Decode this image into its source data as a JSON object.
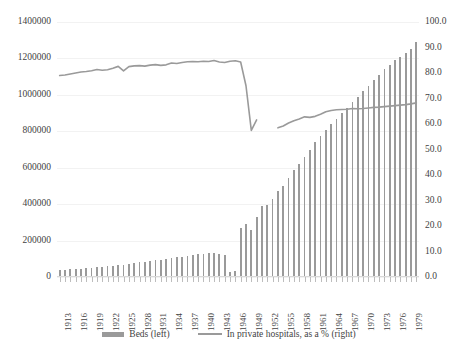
{
  "chart_data": {
    "type": "bar",
    "title": "",
    "subtitle": "",
    "xlabel": "",
    "ylabel": "",
    "grid": true,
    "legend_position": "bottom",
    "axes": {
      "left": {
        "label": "",
        "ylim": [
          0,
          1400000
        ],
        "ticks": [
          0,
          200000,
          400000,
          600000,
          800000,
          1000000,
          1200000,
          1400000
        ],
        "ticklabels": [
          "0",
          "200000",
          "400000",
          "600000",
          "800000",
          "1000000",
          "1200000",
          "1400000"
        ]
      },
      "right": {
        "label": "",
        "ylim": [
          0,
          100
        ],
        "ticks": [
          0,
          10,
          20,
          30,
          40,
          50,
          60,
          70,
          80,
          90,
          100
        ],
        "ticklabels": [
          "0.0",
          "10.0",
          "20.0",
          "30.0",
          "40.0",
          "50.0",
          "60.0",
          "70.0",
          "80.0",
          "90.0",
          "100.0"
        ]
      }
    },
    "categories": [
      "1913",
      "1914",
      "1915",
      "1916",
      "1917",
      "1918",
      "1919",
      "1920",
      "1921",
      "1922",
      "1923",
      "1924",
      "1925",
      "1926",
      "1927",
      "1928",
      "1929",
      "1930",
      "1931",
      "1932",
      "1933",
      "1934",
      "1935",
      "1936",
      "1937",
      "1938",
      "1939",
      "1940",
      "1941",
      "1942",
      "1943",
      "1944",
      "1945",
      "1946",
      "1947",
      "1948",
      "1949",
      "1950",
      "1951",
      "1952",
      "1953",
      "1954",
      "1955",
      "1956",
      "1957",
      "1958",
      "1959",
      "1960",
      "1961",
      "1962",
      "1963",
      "1964",
      "1965",
      "1966",
      "1967",
      "1968",
      "1969",
      "1970",
      "1971",
      "1972",
      "1973",
      "1974",
      "1975",
      "1976",
      "1977",
      "1978",
      "1979",
      "1980"
    ],
    "xtick_labels_shown": [
      "1913",
      "1916",
      "1919",
      "1922",
      "1925",
      "1928",
      "1931",
      "1934",
      "1937",
      "1940",
      "1943",
      "1946",
      "1949",
      "1952",
      "1955",
      "1958",
      "1961",
      "1964",
      "1967",
      "1970",
      "1973",
      "1976",
      "1979"
    ],
    "series": [
      {
        "name": "Beds (left)",
        "type": "bar",
        "axis": "left",
        "color": "#9a9a9a",
        "values": [
          38000,
          40000,
          42000,
          44000,
          46000,
          48000,
          50000,
          53000,
          56000,
          59000,
          62000,
          65000,
          68000,
          72000,
          76000,
          80000,
          84000,
          88000,
          92000,
          96000,
          100000,
          104000,
          108000,
          112000,
          116000,
          120000,
          124000,
          128000,
          132000,
          134000,
          128000,
          120000,
          30000,
          34000,
          268000,
          290000,
          260000,
          330000,
          390000,
          395000,
          430000,
          470000,
          500000,
          545000,
          590000,
          620000,
          660000,
          700000,
          740000,
          775000,
          805000,
          840000,
          870000,
          900000,
          930000,
          960000,
          990000,
          1020000,
          1050000,
          1080000,
          1110000,
          1140000,
          1165000,
          1190000,
          1210000,
          1230000,
          1250000,
          1290000
        ]
      },
      {
        "name": "In private hospitals, as a % (right)",
        "type": "line",
        "axis": "right",
        "color": "#9a9a9a",
        "values": [
          79.0,
          79.2,
          79.6,
          80.0,
          80.4,
          80.6,
          80.9,
          81.4,
          81.1,
          81.3,
          81.9,
          82.6,
          80.8,
          82.5,
          82.8,
          82.9,
          82.7,
          83.1,
          83.3,
          83.0,
          83.2,
          83.9,
          83.7,
          84.1,
          84.4,
          84.5,
          84.4,
          84.6,
          84.5,
          84.9,
          84.3,
          84.1,
          84.6,
          84.8,
          84.3,
          75.0,
          57.5,
          61.6,
          null,
          null,
          null,
          58.5,
          59.2,
          60.4,
          61.3,
          62.0,
          62.8,
          62.6,
          63.0,
          63.8,
          64.8,
          65.3,
          65.6,
          65.7,
          65.8,
          66.1,
          66.0,
          66.1,
          66.3,
          66.5,
          66.6,
          66.8,
          67.0,
          67.2,
          67.4,
          67.6,
          67.9,
          68.3
        ],
        "gap_note": "break in series between 1950 and 1953"
      }
    ]
  },
  "legend": {
    "items": [
      {
        "label": "Beds (left)",
        "marker": "bar-swatch"
      },
      {
        "label": "In private hospitals, as a % (right)",
        "marker": "line-swatch"
      }
    ]
  },
  "colors": {
    "bar": "#9a9a9a",
    "line": "#9a9a9a",
    "grid": "#f2f2f2",
    "text": "#3f3f3f",
    "background": "#ffffff"
  }
}
